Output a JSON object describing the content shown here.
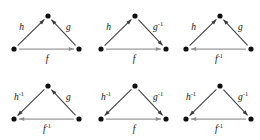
{
  "figure": {
    "background_color": "#ffffff",
    "node_color": "#111111",
    "diagonal_edge_color": "#3a3a3a",
    "base_edge_color": "#9a9a9a",
    "rows": 2,
    "columns": 3,
    "node_count_per_diagram": 3
  },
  "diagrams": [
    {
      "id": "diagram-1",
      "row": 0,
      "column": 0,
      "left_edge": {
        "label": "h",
        "exponent": "",
        "direction": "up-right"
      },
      "right_edge": {
        "label": "g",
        "exponent": "",
        "direction": "up-left"
      },
      "base_edge": {
        "label": "f",
        "exponent": "",
        "direction": "right"
      }
    },
    {
      "id": "diagram-2",
      "row": 0,
      "column": 1,
      "left_edge": {
        "label": "h",
        "exponent": "",
        "direction": "up-right"
      },
      "right_edge": {
        "label": "g",
        "exponent": "-1",
        "direction": "down-right"
      },
      "base_edge": {
        "label": "f",
        "exponent": "",
        "direction": "right"
      }
    },
    {
      "id": "diagram-3",
      "row": 0,
      "column": 2,
      "left_edge": {
        "label": "h",
        "exponent": "",
        "direction": "up-right"
      },
      "right_edge": {
        "label": "g",
        "exponent": "",
        "direction": "up-left"
      },
      "base_edge": {
        "label": "f",
        "exponent": "-1",
        "direction": "left"
      }
    },
    {
      "id": "diagram-4",
      "row": 1,
      "column": 0,
      "left_edge": {
        "label": "h",
        "exponent": "-1",
        "direction": "down-left"
      },
      "right_edge": {
        "label": "g",
        "exponent": "",
        "direction": "up-left"
      },
      "base_edge": {
        "label": "f",
        "exponent": "-1",
        "direction": "left"
      }
    },
    {
      "id": "diagram-5",
      "row": 1,
      "column": 1,
      "left_edge": {
        "label": "h",
        "exponent": "-1",
        "direction": "down-left"
      },
      "right_edge": {
        "label": "g",
        "exponent": "-1",
        "direction": "down-right"
      },
      "base_edge": {
        "label": "f",
        "exponent": "",
        "direction": "right"
      }
    },
    {
      "id": "diagram-6",
      "row": 1,
      "column": 2,
      "left_edge": {
        "label": "h",
        "exponent": "-1",
        "direction": "down-left"
      },
      "right_edge": {
        "label": "g",
        "exponent": "-1",
        "direction": "down-right"
      },
      "base_edge": {
        "label": "f",
        "exponent": "-1",
        "direction": "left"
      }
    }
  ]
}
